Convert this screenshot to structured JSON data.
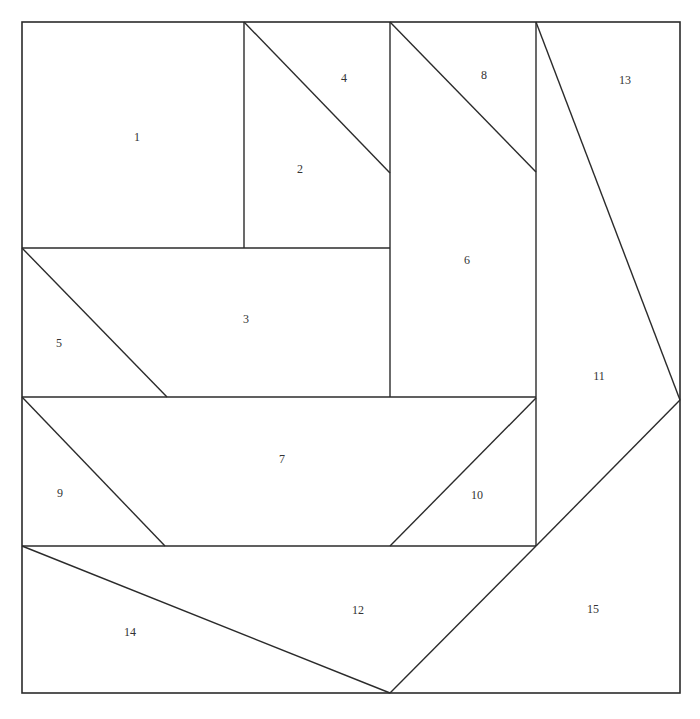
{
  "diagram": {
    "title": "",
    "line_color": "#2b2b2b",
    "background_color": "#ffffff",
    "pieces": [
      {
        "id": "1",
        "label": "1"
      },
      {
        "id": "2",
        "label": "2"
      },
      {
        "id": "3",
        "label": "3"
      },
      {
        "id": "4",
        "label": "4"
      },
      {
        "id": "5",
        "label": "5"
      },
      {
        "id": "6",
        "label": "6"
      },
      {
        "id": "7",
        "label": "7"
      },
      {
        "id": "8",
        "label": "8"
      },
      {
        "id": "9",
        "label": "9"
      },
      {
        "id": "10",
        "label": "10"
      },
      {
        "id": "11",
        "label": "11"
      },
      {
        "id": "12",
        "label": "12"
      },
      {
        "id": "13",
        "label": "13"
      },
      {
        "id": "14",
        "label": "14"
      },
      {
        "id": "15",
        "label": "15"
      }
    ]
  }
}
